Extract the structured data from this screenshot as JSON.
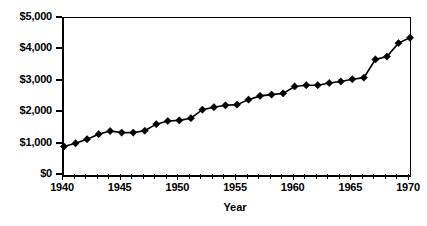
{
  "chart_data": {
    "type": "line",
    "title": "",
    "subtitle": "",
    "xlabel": "Year",
    "ylabel": "",
    "xlim": [
      1940,
      1970
    ],
    "ylim": [
      0,
      5000
    ],
    "grid": false,
    "legend": null,
    "marker": "diamond",
    "line_color": "#000000",
    "marker_color": "#000000",
    "y_tick_labels": [
      "$0",
      "$1,000",
      "$2,000",
      "$3,000",
      "$4,000",
      "$5,000"
    ],
    "y_tick_values": [
      0,
      1000,
      2000,
      3000,
      4000,
      5000
    ],
    "x_tick_labels": [
      "1940",
      "1945",
      "1950",
      "1955",
      "1960",
      "1965",
      "1970"
    ],
    "x_tick_values": [
      1940,
      1945,
      1950,
      1955,
      1960,
      1965,
      1970
    ],
    "x_minor_tick_interval": 1,
    "x": [
      1940,
      1941,
      1942,
      1943,
      1944,
      1945,
      1946,
      1947,
      1948,
      1949,
      1950,
      1951,
      1952,
      1953,
      1954,
      1955,
      1956,
      1957,
      1958,
      1959,
      1960,
      1961,
      1962,
      1963,
      1964,
      1965,
      1966,
      1967,
      1968,
      1969,
      1970
    ],
    "values": [
      910,
      1010,
      1140,
      1300,
      1400,
      1350,
      1350,
      1410,
      1620,
      1720,
      1740,
      1810,
      2080,
      2160,
      2220,
      2240,
      2400,
      2520,
      2560,
      2600,
      2820,
      2860,
      2860,
      2930,
      2980,
      3050,
      3100,
      3680,
      3770,
      4200,
      4370
    ],
    "categories": [
      "1940",
      "1941",
      "1942",
      "1943",
      "1944",
      "1945",
      "1946",
      "1947",
      "1948",
      "1949",
      "1950",
      "1951",
      "1952",
      "1953",
      "1954",
      "1955",
      "1956",
      "1957",
      "1958",
      "1959",
      "1960",
      "1961",
      "1962",
      "1963",
      "1964",
      "1965",
      "1966",
      "1967",
      "1968",
      "1969",
      "1970"
    ]
  }
}
